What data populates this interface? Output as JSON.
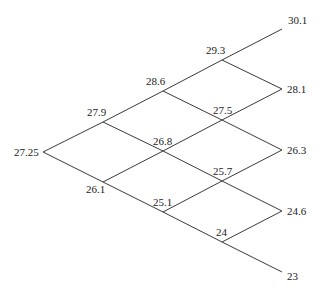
{
  "diagram": {
    "type": "binomial-tree",
    "levels": 4,
    "nodes": [
      {
        "id": "n0_0",
        "label": "27.25",
        "x": 43,
        "y": 152,
        "lx": 14,
        "ly": 156,
        "anchor": "start"
      },
      {
        "id": "n1_0",
        "label": "27.9",
        "x": 103,
        "y": 122,
        "lx": 87,
        "ly": 116,
        "anchor": "start"
      },
      {
        "id": "n1_1",
        "label": "26.1",
        "x": 103,
        "y": 182,
        "lx": 86,
        "ly": 193,
        "anchor": "start"
      },
      {
        "id": "n2_0",
        "label": "28.6",
        "x": 163,
        "y": 91,
        "lx": 146,
        "ly": 85,
        "anchor": "start"
      },
      {
        "id": "n2_1",
        "label": "26.8",
        "x": 163,
        "y": 151,
        "lx": 153,
        "ly": 145,
        "anchor": "start"
      },
      {
        "id": "n2_2",
        "label": "25.1",
        "x": 163,
        "y": 212,
        "lx": 153,
        "ly": 206,
        "anchor": "start"
      },
      {
        "id": "n3_0",
        "label": "29.3",
        "x": 222,
        "y": 60,
        "lx": 206,
        "ly": 54,
        "anchor": "start"
      },
      {
        "id": "n3_1",
        "label": "27.5",
        "x": 222,
        "y": 120,
        "lx": 213,
        "ly": 114,
        "anchor": "start"
      },
      {
        "id": "n3_2",
        "label": "25.7",
        "x": 222,
        "y": 181,
        "lx": 213,
        "ly": 175,
        "anchor": "start"
      },
      {
        "id": "n3_3",
        "label": "24",
        "x": 222,
        "y": 242,
        "lx": 216,
        "ly": 236,
        "anchor": "start"
      },
      {
        "id": "n4_0",
        "label": "30.1",
        "x": 282,
        "y": 29,
        "lx": 288,
        "ly": 24,
        "anchor": "start"
      },
      {
        "id": "n4_1",
        "label": "28.1",
        "x": 282,
        "y": 89,
        "lx": 287,
        "ly": 93,
        "anchor": "start"
      },
      {
        "id": "n4_2",
        "label": "26.3",
        "x": 282,
        "y": 150,
        "lx": 287,
        "ly": 154,
        "anchor": "start"
      },
      {
        "id": "n4_3",
        "label": "24.6",
        "x": 282,
        "y": 211,
        "lx": 287,
        "ly": 215,
        "anchor": "start"
      },
      {
        "id": "n4_4",
        "label": "23",
        "x": 282,
        "y": 272,
        "lx": 287,
        "ly": 280,
        "anchor": "start"
      }
    ],
    "edges": [
      [
        "n0_0",
        "n1_0"
      ],
      [
        "n0_0",
        "n1_1"
      ],
      [
        "n1_0",
        "n2_0"
      ],
      [
        "n1_0",
        "n2_1"
      ],
      [
        "n1_1",
        "n2_1"
      ],
      [
        "n1_1",
        "n2_2"
      ],
      [
        "n2_0",
        "n3_0"
      ],
      [
        "n2_0",
        "n3_1"
      ],
      [
        "n2_1",
        "n3_1"
      ],
      [
        "n2_1",
        "n3_2"
      ],
      [
        "n2_2",
        "n3_2"
      ],
      [
        "n2_2",
        "n3_3"
      ],
      [
        "n3_0",
        "n4_0"
      ],
      [
        "n3_0",
        "n4_1"
      ],
      [
        "n3_1",
        "n4_1"
      ],
      [
        "n3_1",
        "n4_2"
      ],
      [
        "n3_2",
        "n4_2"
      ],
      [
        "n3_2",
        "n4_3"
      ],
      [
        "n3_3",
        "n4_3"
      ],
      [
        "n3_3",
        "n4_4"
      ]
    ],
    "colors": {
      "line": "#3a3a3a",
      "text": "#222222",
      "background": "#ffffff"
    }
  }
}
